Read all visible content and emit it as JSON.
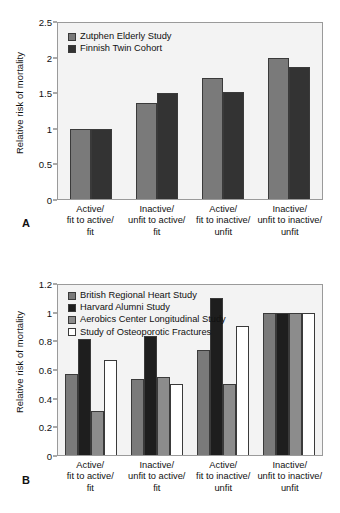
{
  "figure": {
    "caption_fragment": ""
  },
  "panels": [
    {
      "letter": "A",
      "ylabel": "Relative risk of mortality",
      "yticks": [
        "0",
        "0.5",
        "1",
        "1.5",
        "2",
        "2.5"
      ],
      "categories": [
        [
          "Active/",
          "fit to active/",
          "fit"
        ],
        [
          "Inactive/",
          "unfit to active/",
          "fit"
        ],
        [
          "Active/",
          "fit to inactive/",
          "unfit"
        ],
        [
          "Inactive/",
          "unfit to inactive/",
          "unfit"
        ]
      ],
      "legend": [
        {
          "label": "Zutphen Elderly Study",
          "color": "#7a7a7a"
        },
        {
          "label": "Finnish Twin Cohort",
          "color": "#333333"
        }
      ]
    },
    {
      "letter": "B",
      "ylabel": "Relative risk of mortality",
      "yticks": [
        "0",
        "0.2",
        "0.4",
        "0.6",
        "0.8",
        "1",
        "1.2"
      ],
      "categories": [
        [
          "Active/",
          "fit to active/",
          "fit"
        ],
        [
          "Inactive/",
          "unfit to active/",
          "fit"
        ],
        [
          "Active/",
          "fit to inactive/",
          "unfit"
        ],
        [
          "Inactive/",
          "unfit to inactive/",
          "unfit"
        ]
      ],
      "legend": [
        {
          "label": "British Regional Heart Study",
          "color": "#7a7a7a"
        },
        {
          "label": "Harvard Alumni Study",
          "color": "#1e1e1e"
        },
        {
          "label": "Aerobics Center Longitudinal Study",
          "color": "#8c8c8c"
        },
        {
          "label": "Study of Osteoporotic Fractures",
          "color": "#ffffff"
        }
      ]
    }
  ],
  "chart_data": [
    {
      "type": "bar",
      "panel": "A",
      "title": "",
      "xlabel": "",
      "ylabel": "Relative risk of mortality",
      "ylim": [
        0,
        2.5
      ],
      "ytick_values": [
        0,
        0.5,
        1,
        1.5,
        2,
        2.5
      ],
      "grid": false,
      "legend_position": "top-left",
      "categories": [
        "Active/ fit to active/ fit",
        "Inactive/ unfit to active/ fit",
        "Active/ fit to inactive/ unfit",
        "Inactive/ unfit to inactive/ unfit"
      ],
      "series": [
        {
          "name": "Zutphen Elderly Study",
          "color": "#7a7a7a",
          "values": [
            1.0,
            1.36,
            1.72,
            2.0
          ]
        },
        {
          "name": "Finnish Twin Cohort",
          "color": "#333333",
          "values": [
            1.0,
            1.51,
            1.52,
            1.88
          ]
        }
      ]
    },
    {
      "type": "bar",
      "panel": "B",
      "title": "",
      "xlabel": "",
      "ylabel": "Relative risk of mortality",
      "ylim": [
        0,
        1.2
      ],
      "ytick_values": [
        0,
        0.2,
        0.4,
        0.6,
        0.8,
        1,
        1.2
      ],
      "grid": false,
      "legend_position": "top-left",
      "categories": [
        "Active/ fit to active/ fit",
        "Inactive/ unfit to active/ fit",
        "Active/ fit to inactive/ unfit",
        "Inactive/ unfit to inactive/ unfit"
      ],
      "series": [
        {
          "name": "British Regional Heart Study",
          "color": "#7a7a7a",
          "values": [
            0.57,
            0.54,
            0.74,
            1.0
          ]
        },
        {
          "name": "Harvard Alumni Study",
          "color": "#1e1e1e",
          "values": [
            0.82,
            0.84,
            1.11,
            1.0
          ]
        },
        {
          "name": "Aerobics Center Longitudinal Study",
          "color": "#8c8c8c",
          "values": [
            0.31,
            0.55,
            0.5,
            1.0
          ]
        },
        {
          "name": "Study of Osteoporotic Fractures",
          "color": "#ffffff",
          "values": [
            0.67,
            0.5,
            0.91,
            1.0
          ]
        }
      ]
    }
  ]
}
